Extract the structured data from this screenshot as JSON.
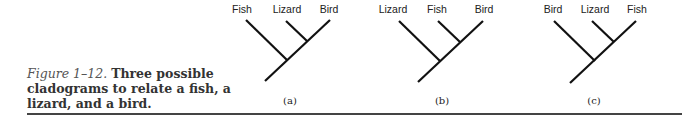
{
  "caption": {
    "figure_label": "Figure 1–12.",
    "text": "Three possible cladograms to relate a fish, a lizard, and a bird."
  },
  "cladograms": [
    {
      "id": "a",
      "label": "(a)",
      "taxa": [
        "Fish",
        "Lizard",
        "Bird"
      ]
    },
    {
      "id": "b",
      "label": "(b)",
      "taxa": [
        "Lizard",
        "Fish",
        "Bird"
      ]
    },
    {
      "id": "c",
      "label": "(c)",
      "taxa": [
        "Bird",
        "Lizard",
        "Fish"
      ]
    }
  ],
  "colors": {
    "line": "#111111",
    "rule": "#444444"
  }
}
